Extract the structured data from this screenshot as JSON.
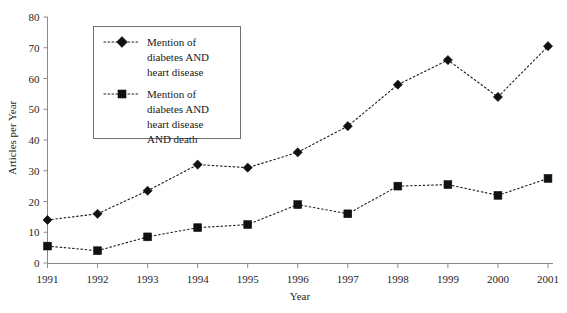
{
  "chart_data": {
    "type": "line",
    "title": "",
    "xlabel": "Year",
    "ylabel": "Articles per Year",
    "categories": [
      "1991",
      "1992",
      "1993",
      "1994",
      "1995",
      "1996",
      "1997",
      "1998",
      "1999",
      "2000",
      "2001"
    ],
    "x": [
      1991,
      1992,
      1993,
      1994,
      1995,
      1996,
      1997,
      1998,
      1999,
      2000,
      2001
    ],
    "xlim": [
      1991,
      2001
    ],
    "ylim": [
      0,
      80
    ],
    "ytick_values": [
      0,
      10,
      20,
      30,
      40,
      50,
      60,
      70,
      80
    ],
    "ytick_labels": [
      "0",
      "10",
      "20",
      "30",
      "40",
      "50",
      "60",
      "70",
      "80"
    ],
    "xtick_labels": [
      "1991",
      "1992",
      "1993",
      "1994",
      "1995",
      "1996",
      "1997",
      "1998",
      "1999",
      "2000",
      "2001"
    ],
    "grid": false,
    "legend_position": "upper-left-inside",
    "series": [
      {
        "name": "Mention of diabetes AND heart disease",
        "marker": "diamond",
        "linestyle": "dotted",
        "color": "#111111",
        "values": [
          14,
          16,
          23.5,
          32,
          31,
          36,
          44.5,
          58,
          66,
          54,
          70.5
        ]
      },
      {
        "name": "Mention of diabetes AND heart disease AND death",
        "marker": "square",
        "linestyle": "dotted",
        "color": "#111111",
        "values": [
          5.5,
          4,
          8.5,
          11.5,
          12.5,
          19,
          16,
          25,
          25.5,
          22,
          27.5
        ]
      }
    ]
  },
  "legend": {
    "entries": [
      {
        "marker": "diamond-marker-icon",
        "line1": "Mention of",
        "line2": "diabetes AND",
        "line3": "heart disease",
        "line4": ""
      },
      {
        "marker": "square-marker-icon",
        "line1": "Mention of",
        "line2": "diabetes AND",
        "line3": "heart disease",
        "line4": "AND death"
      }
    ]
  },
  "axes": {
    "y_title": "Articles per Year",
    "x_title": "Year"
  }
}
